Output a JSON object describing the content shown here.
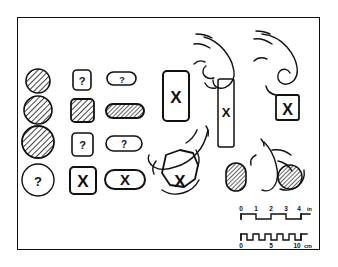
{
  "figure": {
    "frame": {
      "stroke": "#111111",
      "fill": "#ffffff"
    },
    "ink": "#111111",
    "hatch": "#111111",
    "background": "#ffffff"
  },
  "columns": [
    {
      "name": "circles",
      "items": [
        {
          "shape": "circle",
          "size": "small",
          "fill": "hatched",
          "mark": ""
        },
        {
          "shape": "circle",
          "size": "medium",
          "fill": "hatched",
          "mark": ""
        },
        {
          "shape": "circle",
          "size": "large",
          "fill": "hatched",
          "mark": ""
        },
        {
          "shape": "circle",
          "size": "large",
          "fill": "none",
          "mark": "?"
        }
      ]
    },
    {
      "name": "rounded-squares",
      "items": [
        {
          "shape": "rounded-square",
          "size": "small",
          "fill": "none",
          "mark": "?"
        },
        {
          "shape": "rounded-square",
          "size": "medium",
          "fill": "hatched",
          "mark": ""
        },
        {
          "shape": "rounded-square",
          "size": "medium",
          "fill": "none",
          "mark": "?"
        },
        {
          "shape": "rounded-square",
          "size": "large",
          "fill": "none",
          "mark": "X"
        }
      ]
    },
    {
      "name": "pills",
      "items": [
        {
          "shape": "pill",
          "size": "small",
          "fill": "none",
          "mark": "?"
        },
        {
          "shape": "pill",
          "size": "medium",
          "fill": "hatched",
          "mark": ""
        },
        {
          "shape": "pill",
          "size": "medium",
          "fill": "none",
          "mark": "?"
        },
        {
          "shape": "pill",
          "size": "large",
          "fill": "none",
          "mark": "X"
        }
      ]
    }
  ],
  "objects": {
    "large_rect": {
      "mark": "X"
    },
    "free_oval": {
      "mark": "",
      "fill": "hatched"
    }
  },
  "hands": [
    {
      "id": "hand-top-middle",
      "grip": "pinch",
      "object": "tall-bar",
      "mark": "X"
    },
    {
      "id": "hand-top-right",
      "grip": "pinch",
      "object": "small-rectangle",
      "mark": "X"
    },
    {
      "id": "hand-bottom-left",
      "grip": "grasp",
      "object": "polygon",
      "mark": "X"
    },
    {
      "id": "hand-bottom-right",
      "grip": "grasp",
      "object": "hatched-circle",
      "mark": ""
    }
  ],
  "scales": {
    "inch": {
      "unit": "in",
      "ticks": [
        "0",
        "1",
        "2",
        "3",
        "4"
      ],
      "unit_label": "in"
    },
    "cm": {
      "unit": "cm",
      "ticks": [
        "0",
        "5",
        "10"
      ],
      "unit_label": "cm"
    }
  }
}
